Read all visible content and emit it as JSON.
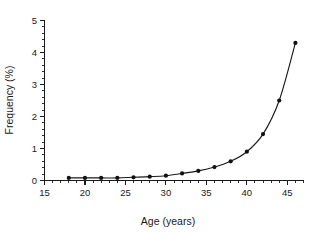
{
  "chart_data": {
    "type": "line",
    "title": "",
    "subtitle": "",
    "xlabel": "Age (years)",
    "ylabel": "Frequency (%)",
    "xlim": [
      15,
      47
    ],
    "ylim": [
      0,
      5
    ],
    "xticks": [
      15,
      20,
      25,
      30,
      35,
      40,
      45
    ],
    "xtick_labels": [
      "15",
      "20",
      "25",
      "30",
      "35",
      "40",
      "45"
    ],
    "yticks": [
      0,
      1,
      2,
      3,
      4,
      5
    ],
    "ytick_labels": [
      "0",
      "1",
      "2",
      "3",
      "4",
      "5"
    ],
    "x_minor_tick_interval": 1,
    "y_minor_tick_interval": 0.2,
    "grid": false,
    "legend": null,
    "marker": "filled-circle",
    "line_color": "#1a1a1a",
    "marker_color": "#111111",
    "background_color": "#ffffff",
    "series": [
      {
        "name": "Frequency by age",
        "x": [
          18,
          20,
          22,
          24,
          26,
          28,
          30,
          32,
          34,
          36,
          38,
          40,
          42,
          44,
          46
        ],
        "values": [
          0.08,
          0.08,
          0.08,
          0.08,
          0.1,
          0.12,
          0.15,
          0.22,
          0.3,
          0.42,
          0.6,
          0.9,
          1.45,
          2.5,
          4.3
        ]
      }
    ],
    "annotations": []
  },
  "axis_titles": {
    "y": "Frequency (%)",
    "x": "Age (years)"
  }
}
